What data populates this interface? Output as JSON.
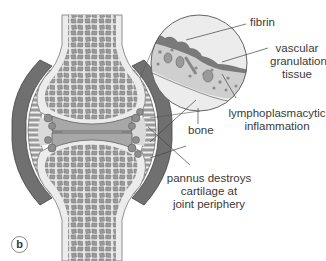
{
  "figure": {
    "panel_letter": "b",
    "colors": {
      "bone_cortex": "#ececec",
      "trabecular_fill": "#9a9a9a",
      "trabecular_edge": "#6e6e6e",
      "cartilage": "#a8a8a8",
      "capsule_dark": "#6a6a6a",
      "synovium": "#8c8c8c",
      "joint_space_light": "#d8d8d8",
      "fibrin": "#7a7a7a",
      "leader_line": "#444444"
    }
  },
  "labels": {
    "fibrin": "fibrin",
    "vascular_granulation_tissue": [
      "vascular",
      "granulation",
      "tissue"
    ],
    "lymphoplasmacytic_inflammation": [
      "lymphoplasmacytic",
      "inflammation"
    ],
    "bone": "bone",
    "pannus": [
      "pannus destroys",
      "cartilage at",
      "joint periphery"
    ]
  }
}
